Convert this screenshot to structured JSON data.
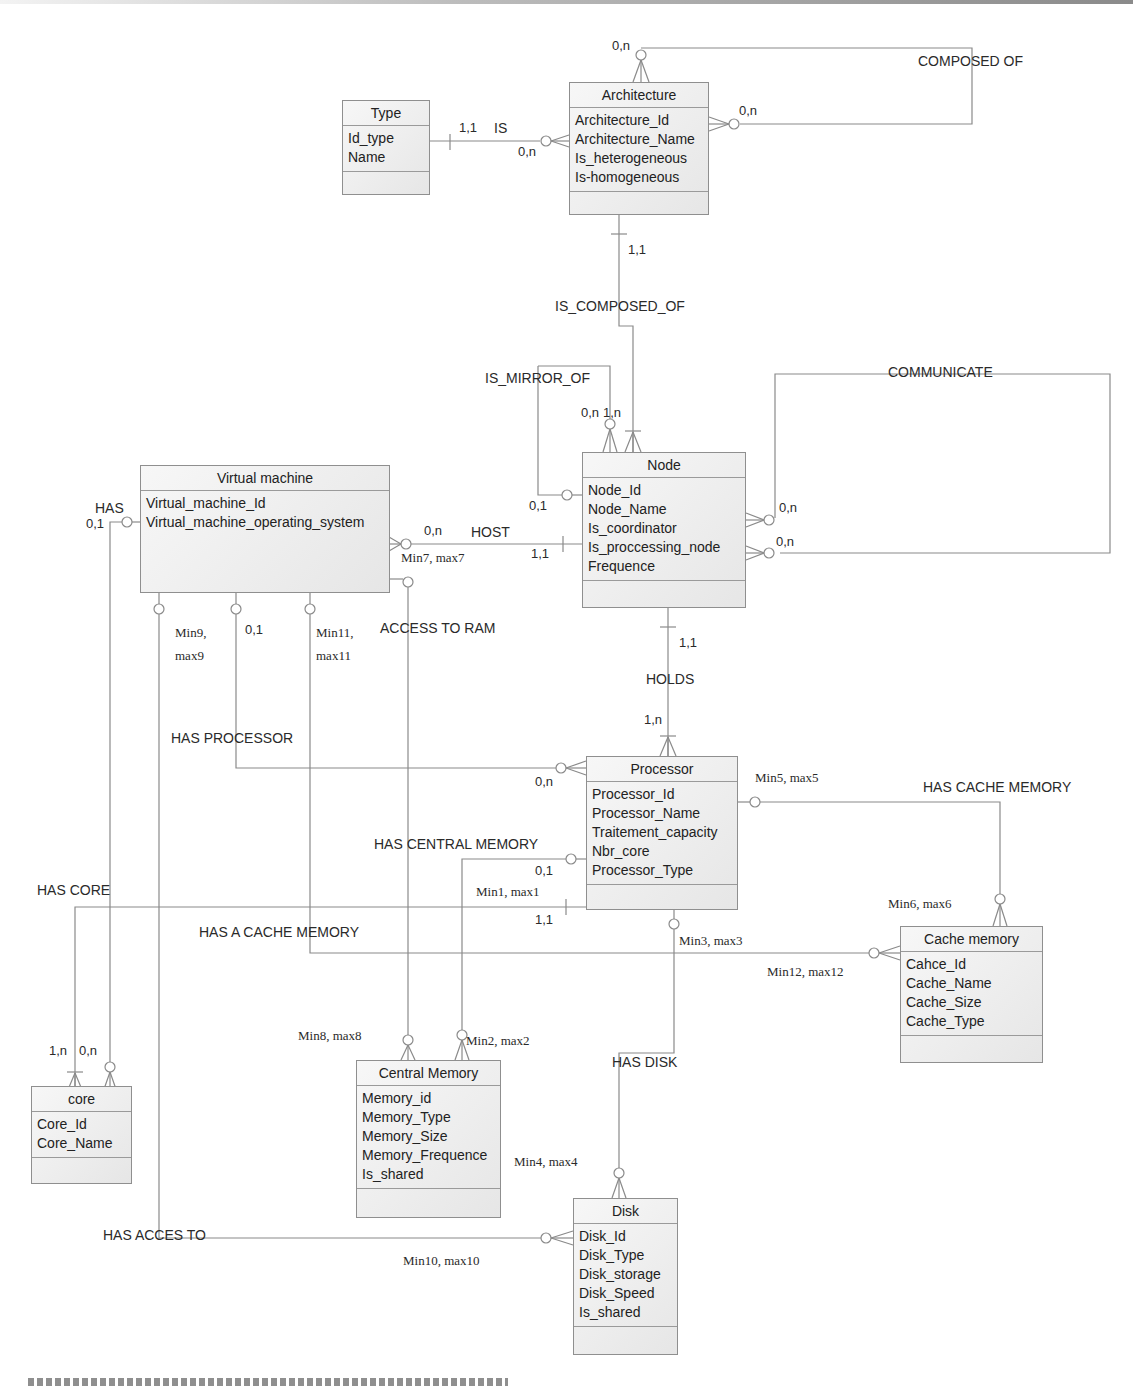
{
  "entities": {
    "type": {
      "title": "Type",
      "attributes": [
        "Id_type",
        "Name"
      ]
    },
    "architecture": {
      "title": "Architecture",
      "attributes": [
        "Architecture_Id",
        "Architecture_Name",
        "Is_heterogeneous",
        "Is-homogeneous"
      ]
    },
    "node": {
      "title": "Node",
      "attributes": [
        "Node_Id",
        "Node_Name",
        "Is_coordinator",
        "Is_proccessing_node",
        "Frequence"
      ]
    },
    "virtual_machine": {
      "title": "Virtual machine",
      "attributes": [
        "Virtual_machine_Id",
        "Virtual_machine_operating_system"
      ]
    },
    "processor": {
      "title": "Processor",
      "attributes": [
        "Processor_Id",
        "Processor_Name",
        "Traitement_capacity",
        "Nbr_core",
        "Processor_Type"
      ]
    },
    "cache_memory": {
      "title": "Cache memory",
      "attributes": [
        "Cahce_Id",
        "Cache_Name",
        "Cache_Size",
        "Cache_Type"
      ]
    },
    "core": {
      "title": "core",
      "attributes": [
        "Core_Id",
        "Core_Name"
      ]
    },
    "central_memory": {
      "title": "Central Memory",
      "attributes": [
        "Memory_id",
        "Memory_Type",
        "Memory_Size",
        "Memory_Frequence",
        "Is_shared"
      ]
    },
    "disk": {
      "title": "Disk",
      "attributes": [
        "Disk_Id",
        "Disk_Type",
        "Disk_storage",
        "Disk_Speed",
        "Is_shared"
      ]
    }
  },
  "relationships": {
    "is": "IS",
    "composed_of": "COMPOSED OF",
    "is_composed_of": "IS_COMPOSED_OF",
    "is_mirror_of": "IS_MIRROR_OF",
    "communicate": "COMMUNICATE",
    "has": "HAS",
    "host": "HOST",
    "access_to_ram": "ACCESS TO RAM",
    "holds": "HOLDS",
    "has_processor": "HAS PROCESSOR",
    "has_cache_memory": "HAS CACHE MEMORY",
    "has_central_memory": "HAS CENTRAL MEMORY",
    "has_core": "HAS CORE",
    "has_a_cache_memory": "HAS A CACHE MEMORY",
    "has_disk": "HAS DISK",
    "has_acces_to": "HAS ACCES TO"
  },
  "cardinalities": {
    "is_type": "1,1",
    "is_arch": "0,n",
    "composed_top": "0,n",
    "composed_right": "0,n",
    "is_composed_arch": "1,1",
    "mirror_a": "0,n",
    "mirror_b": "1,n",
    "mirror_left": "0,1",
    "communicate_a": "0,n",
    "communicate_b": "0,n",
    "host_vm": "0,n",
    "host_node": "1,1",
    "host_vm_minmax": "Min7, max7",
    "has_vm": "0,1",
    "holds_node": "1,1",
    "holds_proc": "1,n",
    "has_processor_vm": "0,1",
    "has_processor_proc": "0,n",
    "vm_min9": "Min9,",
    "vm_max9": "max9",
    "vm_min11": "Min11,",
    "vm_max11": "max11",
    "proc_min5": "Min5, max5",
    "cache_min6": "Min6, max6",
    "central_proc": "0,1",
    "core_proc_minmax": "Min1, max1",
    "core_proc": "1,1",
    "proc_min3": "Min3, max3",
    "cache_min12": "Min12, max12",
    "core_a": "1,n",
    "core_b": "0,n",
    "cm_min8": "Min8, max8",
    "cm_min2": "Min2, max2",
    "disk_min4": "Min4, max4",
    "disk_min10": "Min10, max10"
  }
}
